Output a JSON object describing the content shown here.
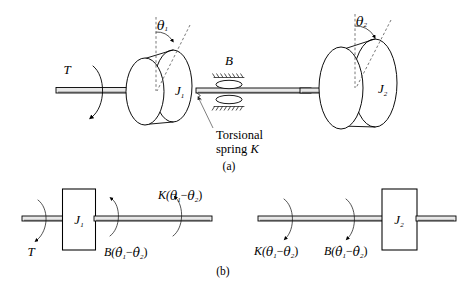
{
  "figure": {
    "background_color": "#ffffff",
    "line_color": "#000000",
    "dashed_color": "#555555",
    "shaft_fill": "#e8e8e8"
  },
  "panel_a": {
    "caption": "(a)",
    "torque_label": "T",
    "inertia_1_label": "J",
    "inertia_1_sub": "1",
    "inertia_2_label": "J",
    "inertia_2_sub": "2",
    "damper_label": "B",
    "angle_1_label": "θ",
    "angle_1_sub": "1",
    "angle_2_label": "θ",
    "angle_2_sub": "2",
    "annotation_line_1": "Torsional",
    "annotation_line_2_prefix": "spring ",
    "annotation_line_2_symbol": "K"
  },
  "panel_b": {
    "caption": "(b)",
    "left": {
      "inertia_label": "J",
      "inertia_sub": "1",
      "torque_label": "T",
      "damping_torque": "B(θ̇₁ − θ̇₂)",
      "spring_torque": "K(θ₁ − θ₂)",
      "damping_prefix": "B(",
      "damping_suffix": ")",
      "spring_prefix": "K(",
      "spring_suffix": ")",
      "minus": "−"
    },
    "right": {
      "inertia_label": "J",
      "inertia_sub": "2",
      "damping_torque": "B(θ̇₁ − θ̇₂)",
      "spring_torque": "K(θ₁ − θ₂)"
    }
  },
  "symbols": {
    "theta": "θ",
    "theta_dot": "θ̇",
    "minus": "−",
    "lparen": "(",
    "rparen": ")",
    "one": "1",
    "two": "2",
    "K": "K",
    "B": "B"
  }
}
